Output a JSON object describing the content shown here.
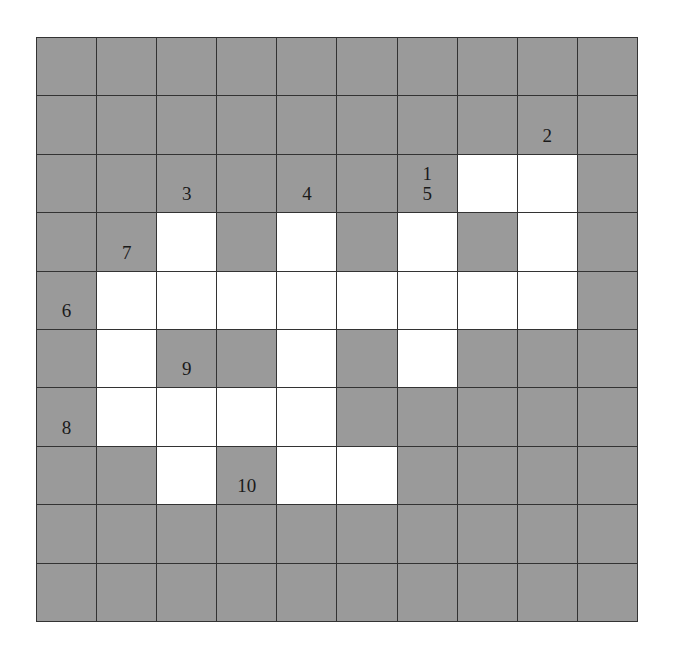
{
  "puzzle": {
    "type": "crossword",
    "rows": 10,
    "cols": 10,
    "colors": {
      "block": "#9a9a9a",
      "open": "#ffffff",
      "line": "#333333"
    },
    "white_cells": [
      [
        2,
        7
      ],
      [
        2,
        8
      ],
      [
        3,
        2
      ],
      [
        3,
        4
      ],
      [
        3,
        6
      ],
      [
        3,
        8
      ],
      [
        4,
        1
      ],
      [
        4,
        2
      ],
      [
        4,
        3
      ],
      [
        4,
        4
      ],
      [
        4,
        5
      ],
      [
        4,
        6
      ],
      [
        4,
        7
      ],
      [
        4,
        8
      ],
      [
        5,
        1
      ],
      [
        5,
        4
      ],
      [
        5,
        6
      ],
      [
        6,
        1
      ],
      [
        6,
        2
      ],
      [
        6,
        3
      ],
      [
        6,
        4
      ],
      [
        7,
        2
      ],
      [
        7,
        4
      ],
      [
        7,
        5
      ]
    ],
    "clue_numbers": [
      {
        "row": 1,
        "col": 8,
        "label": "2"
      },
      {
        "row": 2,
        "col": 2,
        "label": "3"
      },
      {
        "row": 2,
        "col": 4,
        "label": "4"
      },
      {
        "row": 2,
        "col": 6,
        "label": "1\n5"
      },
      {
        "row": 3,
        "col": 1,
        "label": "7"
      },
      {
        "row": 4,
        "col": 0,
        "label": "6"
      },
      {
        "row": 5,
        "col": 2,
        "label": "9"
      },
      {
        "row": 6,
        "col": 0,
        "label": "8"
      },
      {
        "row": 7,
        "col": 3,
        "label": "10"
      }
    ]
  }
}
